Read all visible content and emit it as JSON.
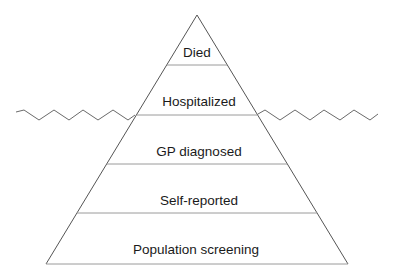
{
  "diagram": {
    "type": "iceberg-pyramid",
    "tiers": [
      {
        "label": "Died"
      },
      {
        "label": "Hospitalized"
      },
      {
        "label": "GP diagnosed"
      },
      {
        "label": "Self-reported"
      },
      {
        "label": "Population screening"
      }
    ],
    "waterline": {
      "between_tiers": [
        "Hospitalized",
        "GP diagnosed"
      ]
    },
    "colors": {
      "edge": "#555555",
      "divider": "#9a9a9a",
      "wave": "#6a6a6a",
      "text": "#1a1a1a",
      "background": "#ffffff"
    }
  }
}
